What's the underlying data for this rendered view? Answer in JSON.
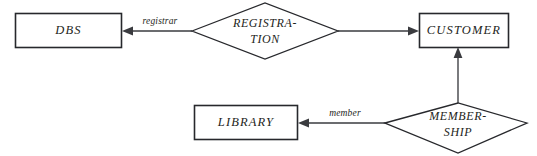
{
  "diagram": {
    "kind": "entity-relationship-diagram",
    "background_color": "#ffffff",
    "line_color": "#3a3b3f",
    "box_stroke_color": "#27282c",
    "text_color": "#1d1e21",
    "entities": [
      {
        "id": "dbs",
        "label": "DBS"
      },
      {
        "id": "customer",
        "label": "CUSTOMER"
      },
      {
        "id": "library",
        "label": "LIBRARY"
      }
    ],
    "relationships": [
      {
        "id": "registration",
        "label_line1": "REGISTRA-",
        "label_line2": "TION"
      },
      {
        "id": "membership",
        "label_line1": "MEMBER-",
        "label_line2": "SHIP"
      }
    ],
    "role_labels": [
      {
        "id": "registrar",
        "label": "registrar"
      },
      {
        "id": "member",
        "label": "member"
      }
    ]
  }
}
